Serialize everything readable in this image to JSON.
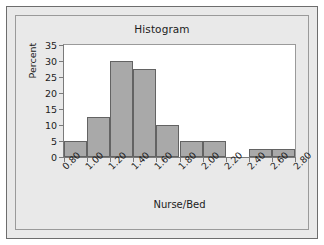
{
  "figure": {
    "title": "Histogram"
  },
  "chart_data": {
    "type": "bar",
    "title": "Histogram",
    "xlabel": "Nurse/Bed",
    "ylabel": "Percent",
    "grid": false,
    "legend": null,
    "xlim": [
      0.8,
      2.8
    ],
    "ylim": [
      0,
      35
    ],
    "xticks": [
      "0.80",
      "1.00",
      "1.20",
      "1.40",
      "1.60",
      "1.80",
      "2.00",
      "2.20",
      "2.40",
      "2.60",
      "2.80"
    ],
    "yticks": [
      "0",
      "5",
      "10",
      "15",
      "20",
      "25",
      "30",
      "35"
    ],
    "bin_width": 0.2,
    "bins": [
      {
        "label": "0.80-1.00",
        "x0": 0.8,
        "x1": 1.0,
        "value": 5.0
      },
      {
        "label": "1.00-1.20",
        "x0": 1.0,
        "x1": 1.2,
        "value": 12.6
      },
      {
        "label": "1.20-1.40",
        "x0": 1.2,
        "x1": 1.4,
        "value": 30.0
      },
      {
        "label": "1.40-1.60",
        "x0": 1.4,
        "x1": 1.6,
        "value": 27.6
      },
      {
        "label": "1.60-1.80",
        "x0": 1.6,
        "x1": 1.8,
        "value": 10.1
      },
      {
        "label": "1.80-2.00",
        "x0": 1.8,
        "x1": 2.0,
        "value": 5.0
      },
      {
        "label": "2.00-2.20",
        "x0": 2.0,
        "x1": 2.2,
        "value": 5.0
      },
      {
        "label": "2.20-2.40",
        "x0": 2.2,
        "x1": 2.4,
        "value": 0.0
      },
      {
        "label": "2.40-2.60",
        "x0": 2.4,
        "x1": 2.6,
        "value": 2.5
      },
      {
        "label": "2.60-2.80",
        "x0": 2.6,
        "x1": 2.8,
        "value": 2.5
      }
    ],
    "categories": [
      "0.80-1.00",
      "1.00-1.20",
      "1.20-1.40",
      "1.40-1.60",
      "1.60-1.80",
      "1.80-2.00",
      "2.00-2.20",
      "2.20-2.40",
      "2.40-2.60",
      "2.60-2.80"
    ],
    "values": [
      5.0,
      12.6,
      30.0,
      27.6,
      10.1,
      5.0,
      5.0,
      0.0,
      2.5,
      2.5
    ],
    "colors": {
      "bar_fill": "#a9a9a9",
      "bar_edge": "#636363",
      "panel_background": "#e9e9e9",
      "plot_background": "#ffffff",
      "axis": "#7a7a7a",
      "text": "#1c1c1c"
    }
  }
}
